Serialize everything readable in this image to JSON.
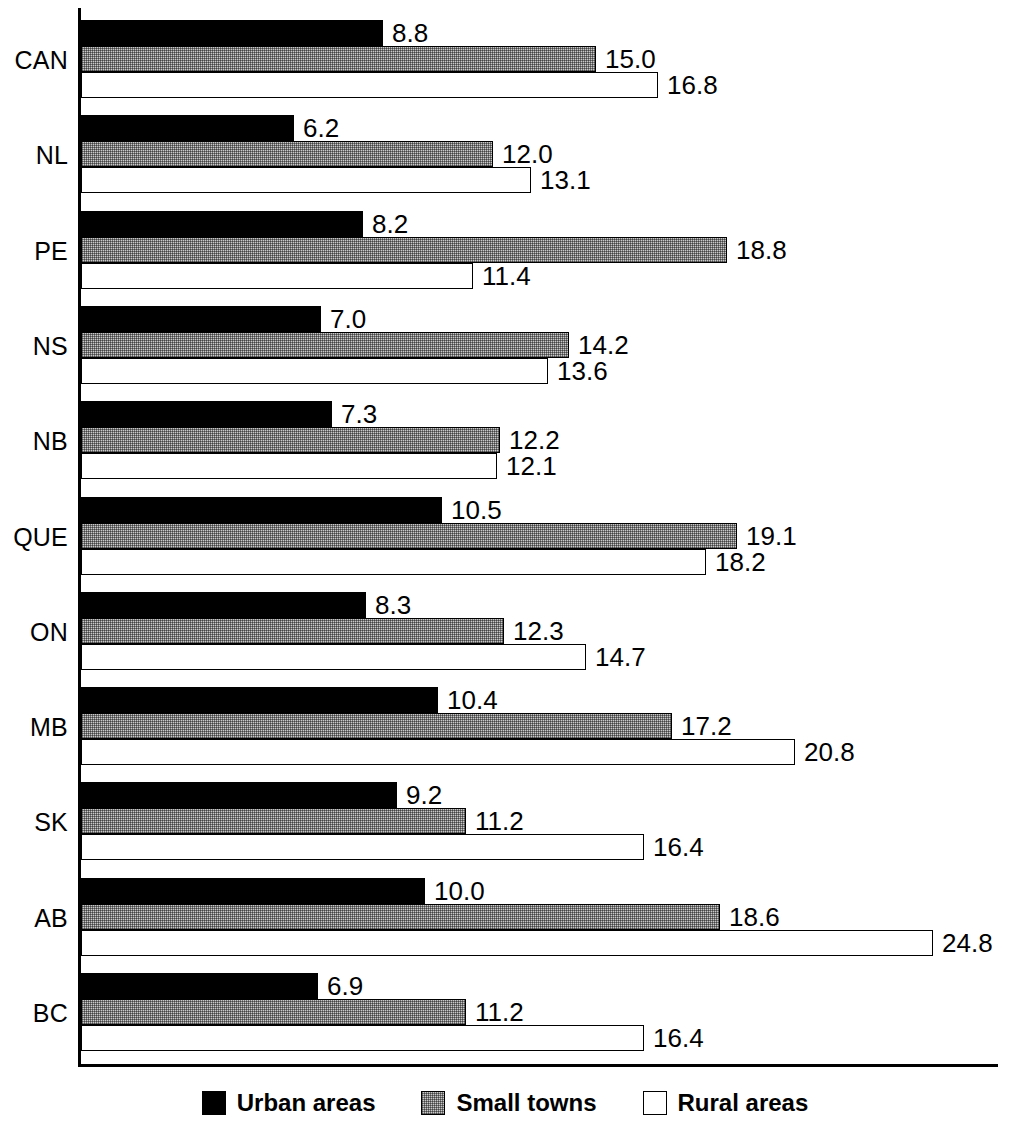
{
  "chart_data": {
    "type": "bar",
    "orientation": "horizontal",
    "title": "",
    "subtitle": "",
    "xlabel": "",
    "ylabel": "",
    "grid": false,
    "legend_position": "bottom",
    "xlim": [
      0,
      24.8
    ],
    "categories": [
      "CAN",
      "NL",
      "PE",
      "NS",
      "NB",
      "QUE",
      "ON",
      "MB",
      "SK",
      "AB",
      "BC"
    ],
    "series": [
      {
        "name": "Urban areas",
        "color": "#000000",
        "values": [
          8.8,
          6.2,
          8.2,
          7.0,
          7.3,
          10.5,
          8.3,
          10.4,
          9.2,
          10.0,
          6.9
        ],
        "labels": [
          "8.8",
          "6.2",
          "8.2",
          "7.0",
          "7.3",
          "10.5",
          "8.3",
          "10.4",
          "9.2",
          "10.0",
          "6.9"
        ]
      },
      {
        "name": "Small towns",
        "color": "#c9c9c9",
        "values": [
          15.0,
          12.0,
          18.8,
          14.2,
          12.2,
          19.1,
          12.3,
          17.2,
          11.2,
          18.6,
          11.2
        ],
        "labels": [
          "15.0",
          "12.0",
          "18.8",
          "14.2",
          "12.2",
          "19.1",
          "12.3",
          "17.2",
          "11.2",
          "18.6",
          "11.2"
        ]
      },
      {
        "name": "Rural areas",
        "color": "#ffffff",
        "values": [
          16.8,
          13.1,
          11.4,
          13.6,
          12.1,
          18.2,
          14.7,
          20.8,
          16.4,
          24.8,
          16.4
        ],
        "labels": [
          "16.8",
          "13.1",
          "11.4",
          "13.6",
          "12.1",
          "18.2",
          "14.7",
          "20.8",
          "16.4",
          "24.8",
          "16.4"
        ]
      }
    ]
  },
  "legend": {
    "items": [
      {
        "label": "Urban areas",
        "swatch": "black-filled-square"
      },
      {
        "label": "Small towns",
        "swatch": "gray-hatched-square"
      },
      {
        "label": "Rural areas",
        "swatch": "white-outlined-square"
      }
    ]
  },
  "axes": {
    "y_axis_name": "category-axis",
    "x_axis_name": "value-baseline"
  }
}
